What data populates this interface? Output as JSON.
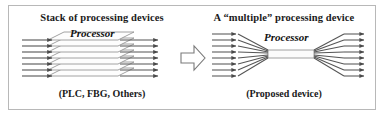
{
  "figure": {
    "frame": {
      "border_color": "#b8b8b8",
      "background_color": "#ffffff"
    },
    "left_panel": {
      "title": "Stack of processing devices",
      "caption": "(PLC, FBG, Others)",
      "processor_label": "Processor",
      "slab_count": 7,
      "channel_count": 7,
      "line_color": "#555555",
      "slab_fill": "#fdfdfd",
      "slab_stroke": "#8a8a8a"
    },
    "transition_arrow": {
      "name": "block-arrow-right",
      "direction": "right",
      "fill": "#ffffff",
      "stroke": "#7a7a7a"
    },
    "right_panel": {
      "title": "A “multiple” processing device",
      "caption": "(Proposed device)",
      "processor_label": "Processor",
      "input_count": 8,
      "output_count": 8,
      "line_color": "#555555",
      "waist_fill": "#fbfbfb",
      "waist_stroke": "#8a8a8a"
    }
  }
}
